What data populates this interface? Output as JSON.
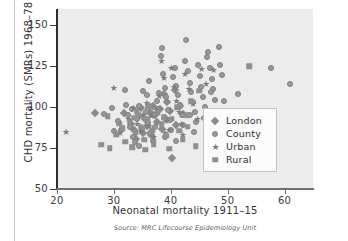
{
  "figure": {
    "source_note": "Source: MRC Lifecourse Epidemiology Unit"
  },
  "legend": {
    "items": [
      {
        "label": "London",
        "marker": "diamond-marker-icon",
        "key": "london"
      },
      {
        "label": "County",
        "marker": "circle-marker-icon",
        "key": "county"
      },
      {
        "label": "Urban",
        "marker": "star-marker-icon",
        "key": "urban"
      },
      {
        "label": "Rural",
        "marker": "square-marker-icon",
        "key": "rural"
      }
    ]
  },
  "chart_data": {
    "type": "scatter",
    "title": "",
    "xlabel": "Neonatal mortality 1911–15",
    "ylabel": "CHD mortality (SMRs) 1968–78",
    "xlim": [
      20,
      65
    ],
    "ylim": [
      50,
      160
    ],
    "xticks": [
      20,
      30,
      40,
      50,
      60
    ],
    "yticks": [
      50,
      75,
      100,
      125,
      150
    ],
    "xtick_labels": [
      "20",
      "30",
      "40",
      "50",
      "60"
    ],
    "ytick_labels": [
      "50",
      "75",
      "100",
      "125",
      "150"
    ],
    "grid": false,
    "legend_position": "bottom-right",
    "series": [
      {
        "name": "London",
        "marker": "diamond",
        "color": "#8a8a8a",
        "points": [
          [
            26.6,
            96.2
          ],
          [
            31.8,
            96.5
          ],
          [
            33.0,
            90.0
          ],
          [
            33.6,
            86.0
          ],
          [
            34.2,
            94.0
          ],
          [
            34.8,
            99.5
          ],
          [
            35.4,
            92.5
          ],
          [
            35.9,
            88.5
          ],
          [
            36.3,
            97.0
          ],
          [
            36.8,
            100.5
          ],
          [
            37.2,
            95.0
          ],
          [
            37.6,
            91.0
          ],
          [
            38.1,
            99.0
          ],
          [
            38.5,
            86.5
          ],
          [
            39.0,
            93.5
          ],
          [
            39.4,
            103.0
          ],
          [
            39.9,
            97.5
          ],
          [
            40.3,
            69.0
          ],
          [
            41.0,
            89.0
          ],
          [
            41.6,
            101.0
          ],
          [
            42.2,
            96.0
          ],
          [
            33.9,
            80.5
          ],
          [
            35.1,
            84.0
          ],
          [
            36.6,
            83.0
          ],
          [
            38.8,
            108.0
          ],
          [
            40.8,
            110.5
          ]
        ]
      },
      {
        "name": "County",
        "marker": "circle",
        "color": "#9a9a9a",
        "points": [
          [
            28.3,
            96.0
          ],
          [
            29.6,
            99.5
          ],
          [
            30.7,
            91.5
          ],
          [
            31.3,
            86.0
          ],
          [
            31.9,
            110.5
          ],
          [
            32.4,
            95.5
          ],
          [
            32.9,
            88.0
          ],
          [
            33.3,
            82.0
          ],
          [
            33.7,
            78.5
          ],
          [
            34.1,
            93.0
          ],
          [
            34.5,
            101.0
          ],
          [
            34.9,
            86.5
          ],
          [
            35.2,
            110.0
          ],
          [
            35.6,
            97.0
          ],
          [
            36.0,
            90.5
          ],
          [
            36.4,
            84.0
          ],
          [
            36.8,
            79.5
          ],
          [
            37.1,
            95.0
          ],
          [
            37.5,
            104.0
          ],
          [
            37.8,
            99.0
          ],
          [
            38.2,
            131.5
          ],
          [
            38.4,
            136.0
          ],
          [
            38.6,
            120.0
          ],
          [
            38.9,
            112.0
          ],
          [
            39.2,
            106.0
          ],
          [
            39.5,
            98.5
          ],
          [
            39.8,
            92.0
          ],
          [
            40.1,
            86.0
          ],
          [
            40.4,
            118.5
          ],
          [
            40.7,
            124.0
          ],
          [
            41.0,
            113.0
          ],
          [
            41.3,
            107.5
          ],
          [
            41.6,
            101.5
          ],
          [
            41.9,
            95.0
          ],
          [
            42.2,
            89.0
          ],
          [
            42.5,
            128.0
          ],
          [
            42.7,
            141.0
          ],
          [
            43.0,
            122.0
          ],
          [
            43.3,
            115.0
          ],
          [
            43.6,
            109.0
          ],
          [
            43.9,
            103.0
          ],
          [
            44.2,
            97.0
          ],
          [
            44.5,
            91.0
          ],
          [
            44.8,
            125.5
          ],
          [
            45.1,
            119.0
          ],
          [
            45.4,
            112.5
          ],
          [
            45.7,
            106.0
          ],
          [
            46.0,
            100.0
          ],
          [
            46.3,
            130.5
          ],
          [
            46.6,
            133.5
          ],
          [
            46.9,
            124.0
          ],
          [
            47.2,
            117.0
          ],
          [
            47.5,
            111.0
          ],
          [
            47.8,
            104.5
          ],
          [
            48.1,
            97.5
          ],
          [
            48.4,
            137.0
          ],
          [
            48.7,
            126.0
          ],
          [
            49.0,
            119.5
          ],
          [
            51.8,
            108.0
          ],
          [
            57.6,
            124.0
          ],
          [
            60.9,
            114.0
          ],
          [
            33.1,
            99.0
          ],
          [
            35.8,
            107.5
          ],
          [
            37.3,
            88.0
          ],
          [
            39.0,
            82.0
          ],
          [
            40.9,
            79.5
          ],
          [
            44.0,
            85.0
          ],
          [
            45.9,
            93.5
          ],
          [
            30.1,
            85.5
          ],
          [
            32.2,
            101.5
          ],
          [
            36.2,
            116.0
          ],
          [
            43.4,
            95.0
          ],
          [
            47.0,
            109.0
          ],
          [
            49.3,
            104.0
          ],
          [
            34.4,
            76.5
          ],
          [
            38.0,
            108.5
          ]
        ]
      },
      {
        "name": "Urban",
        "marker": "star",
        "color": "#7c7c7c",
        "points": [
          [
            21.5,
            85.0
          ],
          [
            29.9,
            112.0
          ],
          [
            32.5,
            92.5
          ],
          [
            33.4,
            99.5
          ],
          [
            34.6,
            85.5
          ],
          [
            35.0,
            95.5
          ],
          [
            35.7,
            102.5
          ],
          [
            36.1,
            88.5
          ],
          [
            36.9,
            81.5
          ],
          [
            37.4,
            98.0
          ],
          [
            37.9,
            107.0
          ],
          [
            38.3,
            128.5
          ],
          [
            38.7,
            118.0
          ],
          [
            39.1,
            91.5
          ],
          [
            39.6,
            86.0
          ],
          [
            40.0,
            124.0
          ],
          [
            40.5,
            112.5
          ],
          [
            40.9,
            104.0
          ],
          [
            41.4,
            97.0
          ],
          [
            41.8,
            89.5
          ],
          [
            42.4,
            120.5
          ],
          [
            43.1,
            111.0
          ],
          [
            43.8,
            102.0
          ],
          [
            44.6,
            93.0
          ],
          [
            45.3,
            123.5
          ],
          [
            46.1,
            114.0
          ],
          [
            47.4,
            123.0
          ],
          [
            34.0,
            90.0
          ],
          [
            36.5,
            94.5
          ],
          [
            38.9,
            84.0
          ],
          [
            42.0,
            83.0
          ],
          [
            31.0,
            84.0
          ]
        ]
      },
      {
        "name": "Rural",
        "marker": "square",
        "color": "#8f8f8f",
        "points": [
          [
            27.8,
            77.0
          ],
          [
            28.9,
            94.5
          ],
          [
            29.3,
            75.0
          ],
          [
            30.4,
            83.5
          ],
          [
            31.5,
            87.0
          ],
          [
            32.0,
            79.0
          ],
          [
            32.8,
            91.0
          ],
          [
            33.2,
            75.5
          ],
          [
            33.8,
            84.5
          ],
          [
            34.3,
            95.5
          ],
          [
            34.7,
            88.0
          ],
          [
            35.3,
            80.0
          ],
          [
            35.9,
            92.5
          ],
          [
            36.7,
            86.0
          ],
          [
            37.0,
            77.5
          ],
          [
            37.7,
            96.5
          ],
          [
            38.4,
            89.5
          ],
          [
            39.3,
            82.5
          ],
          [
            39.7,
            74.5
          ],
          [
            40.2,
            93.0
          ],
          [
            41.1,
            100.0
          ],
          [
            41.5,
            85.5
          ],
          [
            42.1,
            80.5
          ],
          [
            42.8,
            95.0
          ],
          [
            43.5,
            103.5
          ],
          [
            44.4,
            76.0
          ],
          [
            45.0,
            110.0
          ],
          [
            53.8,
            125.0
          ],
          [
            30.9,
            90.0
          ],
          [
            34.0,
            97.5
          ],
          [
            36.0,
            100.5
          ],
          [
            38.8,
            94.0
          ],
          [
            43.0,
            88.0
          ],
          [
            33.5,
            93.5
          ],
          [
            35.5,
            74.0
          ]
        ]
      }
    ]
  }
}
